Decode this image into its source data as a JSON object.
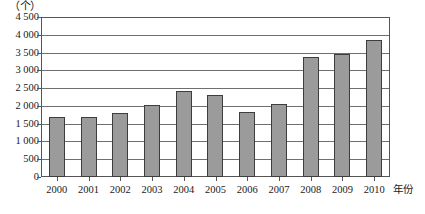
{
  "chart_data": {
    "type": "bar",
    "title": "",
    "subtitle": "",
    "unit_label": "（个）",
    "xlabel": "年份",
    "ylabel": "",
    "categories": [
      "2000",
      "2001",
      "2002",
      "2003",
      "2004",
      "2005",
      "2006",
      "2007",
      "2008",
      "2009",
      "2010"
    ],
    "values": [
      1680,
      1680,
      1810,
      2030,
      2420,
      2300,
      1830,
      2040,
      3370,
      3470,
      3850
    ],
    "ylim": [
      0,
      4500
    ],
    "ytick_step": 500,
    "ytick_labels": [
      "0",
      "500",
      "1 000",
      "1 500",
      "2 000",
      "2 500",
      "3 000",
      "3 500",
      "4 000",
      "4 500"
    ],
    "ytick_values": [
      0,
      500,
      1000,
      1500,
      2000,
      2500,
      3000,
      3500,
      4000,
      4500
    ],
    "grid": true,
    "legend": false,
    "legend_position": "none",
    "series": [
      {
        "name": "",
        "values": [
          1680,
          1680,
          1810,
          2030,
          2420,
          2300,
          1830,
          2040,
          3370,
          3470,
          3850
        ]
      }
    ],
    "colors": {
      "bar_fill": "#9b9b9b",
      "bar_border": "#3d3d3d",
      "gridline": "#6f6f6f",
      "frame": "#555555",
      "text": "#1a1a1a",
      "background": "#ffffff"
    }
  }
}
